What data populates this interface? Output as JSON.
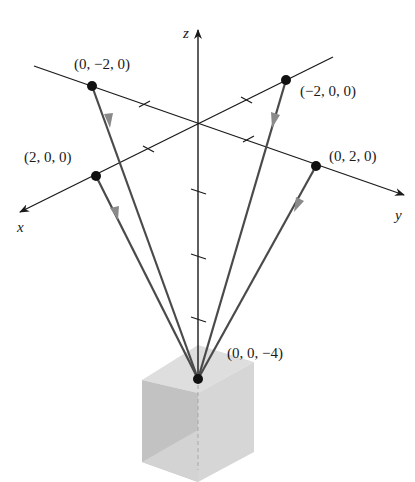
{
  "diagram": {
    "axes": {
      "x_label": "x",
      "y_label": "y",
      "z_label": "z"
    },
    "points": [
      {
        "id": "p_neg_y",
        "label": "(0, −2, 0)"
      },
      {
        "id": "p_neg_x",
        "label": "(−2, 0, 0)"
      },
      {
        "id": "p_pos_x",
        "label": "(2, 0, 0)"
      },
      {
        "id": "p_pos_y",
        "label": "(0, 2, 0)"
      },
      {
        "id": "apex",
        "label": "(0, 0, −4)"
      }
    ],
    "colors": {
      "axis": "#1a1a1a",
      "vector_line": "#4a4a4a",
      "arrow": "#8a8a8a",
      "point": "#111111",
      "cube_top": "#dcdcdc",
      "cube_left": "#bdbdbd",
      "cube_right": "#d2d2d2"
    }
  }
}
